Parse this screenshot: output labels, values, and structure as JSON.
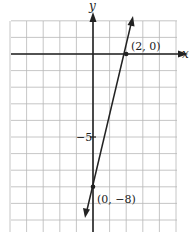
{
  "chart_data": {
    "type": "line",
    "title": "",
    "xlabel": "x",
    "ylabel": "y",
    "xlim": [
      -5,
      5
    ],
    "ylim": [
      -10.7,
      2
    ],
    "grid": true,
    "series": [
      {
        "name": "line through (2, 0) and (0, -8)",
        "equation": "y = 4x - 8",
        "slope": 4,
        "intercept": -8,
        "x": [
          -0.35,
          2.45
        ],
        "y": [
          -9.4,
          1.8
        ]
      }
    ],
    "points": [
      {
        "x": 2,
        "y": 0,
        "label": "(2, 0)"
      },
      {
        "x": 0,
        "y": -8,
        "label": "(0, −8)"
      }
    ],
    "tick_labels": [
      {
        "axis": "y",
        "value": -5,
        "label": "−5"
      }
    ]
  },
  "labels": {
    "x_axis": "x",
    "y_axis": "y",
    "tick_neg5": "−5",
    "point_a": "(2, 0)",
    "point_b": "(0, −8)"
  },
  "colors": {
    "grid": "#b8b8b8",
    "axis": "#222222",
    "line": "#222222"
  }
}
